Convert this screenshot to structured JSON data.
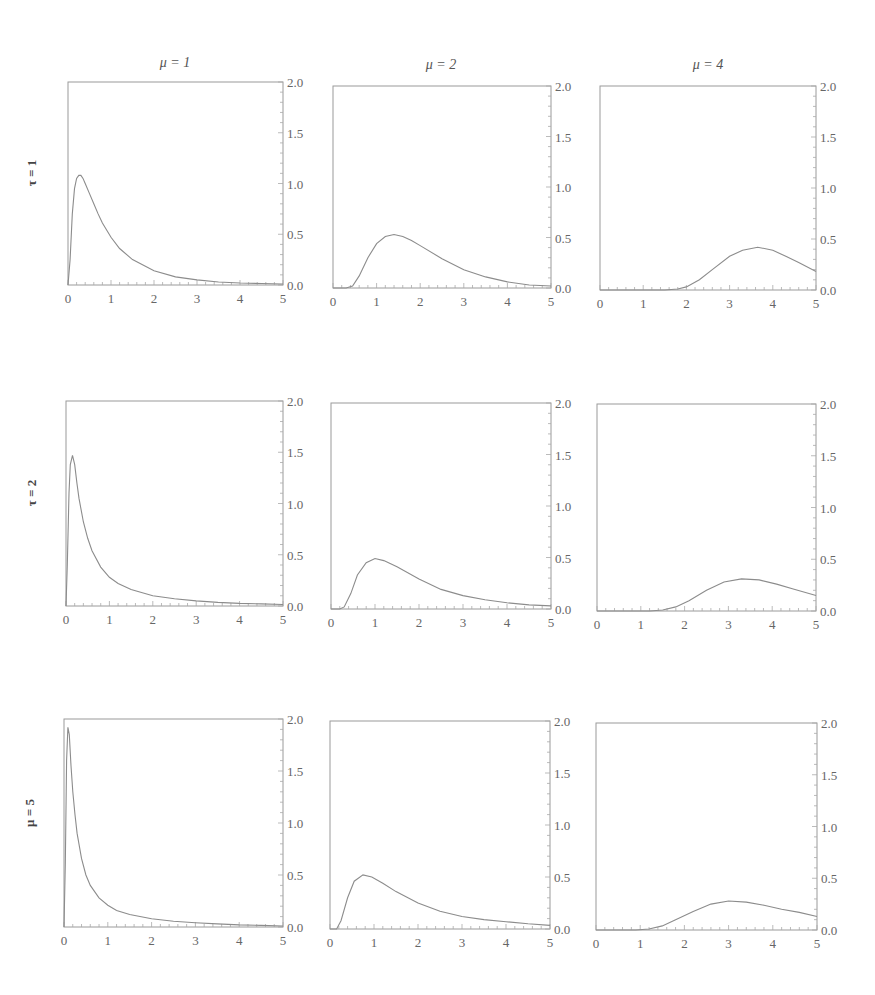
{
  "figure": {
    "column_titles": [
      "μ = 1",
      "μ = 2",
      "μ = 4"
    ],
    "row_titles": [
      "τ = 1",
      "τ = 2",
      "μ = 5"
    ],
    "x_ticks": [
      "0",
      "1",
      "2",
      "3",
      "4",
      "5"
    ],
    "y_ticks": [
      "0.0",
      "0.5",
      "1.0",
      "1.5",
      "2.0"
    ],
    "colors": {
      "curve": "#8c8c8c",
      "frame": "#9a9a9a",
      "text": "#666666"
    }
  },
  "chart_data": [
    {
      "type": "line",
      "row": "τ = 1",
      "col": "μ = 1",
      "xlim": [
        0,
        5
      ],
      "ylim": [
        0,
        2
      ],
      "x": [
        0,
        0.05,
        0.1,
        0.15,
        0.2,
        0.25,
        0.3,
        0.35,
        0.4,
        0.5,
        0.6,
        0.7,
        0.8,
        1.0,
        1.2,
        1.5,
        2.0,
        2.5,
        3.0,
        3.5,
        4.0,
        4.5,
        5.0
      ],
      "y": [
        0,
        0.25,
        0.7,
        0.95,
        1.05,
        1.08,
        1.08,
        1.05,
        1.0,
        0.9,
        0.8,
        0.7,
        0.61,
        0.47,
        0.36,
        0.25,
        0.14,
        0.08,
        0.05,
        0.03,
        0.02,
        0.015,
        0.01
      ]
    },
    {
      "type": "line",
      "row": "τ = 1",
      "col": "μ = 2",
      "xlim": [
        0,
        5
      ],
      "ylim": [
        0,
        2
      ],
      "x": [
        0,
        0.3,
        0.45,
        0.6,
        0.8,
        1.0,
        1.2,
        1.4,
        1.6,
        1.8,
        2.0,
        2.5,
        3.0,
        3.5,
        4.0,
        4.5,
        5.0
      ],
      "y": [
        0,
        0,
        0.02,
        0.12,
        0.3,
        0.44,
        0.51,
        0.53,
        0.51,
        0.47,
        0.42,
        0.29,
        0.18,
        0.11,
        0.06,
        0.03,
        0.02
      ]
    },
    {
      "type": "line",
      "row": "τ = 1",
      "col": "μ = 4",
      "xlim": [
        0,
        5
      ],
      "ylim": [
        0,
        2
      ],
      "x": [
        0,
        1.5,
        1.8,
        2.0,
        2.3,
        2.6,
        3.0,
        3.3,
        3.65,
        4.0,
        4.3,
        4.6,
        5.0
      ],
      "y": [
        0,
        0,
        0.01,
        0.03,
        0.1,
        0.2,
        0.33,
        0.39,
        0.42,
        0.39,
        0.33,
        0.27,
        0.18
      ]
    },
    {
      "type": "line",
      "row": "τ = 2",
      "col": "μ = 1",
      "xlim": [
        0,
        5
      ],
      "ylim": [
        0,
        2
      ],
      "x": [
        0,
        0.03,
        0.07,
        0.1,
        0.15,
        0.2,
        0.25,
        0.3,
        0.4,
        0.5,
        0.6,
        0.8,
        1.0,
        1.2,
        1.5,
        2.0,
        2.5,
        3.0,
        3.5,
        4.0,
        4.5,
        5.0
      ],
      "y": [
        0,
        0.4,
        1.1,
        1.38,
        1.47,
        1.38,
        1.2,
        1.05,
        0.82,
        0.66,
        0.54,
        0.38,
        0.28,
        0.22,
        0.16,
        0.1,
        0.07,
        0.05,
        0.035,
        0.025,
        0.02,
        0.015
      ]
    },
    {
      "type": "line",
      "row": "τ = 2",
      "col": "μ = 2",
      "xlim": [
        0,
        5
      ],
      "ylim": [
        0,
        2
      ],
      "x": [
        0,
        0.2,
        0.3,
        0.45,
        0.6,
        0.8,
        1.0,
        1.2,
        1.5,
        2.0,
        2.5,
        3.0,
        3.5,
        4.0,
        4.5,
        5.0
      ],
      "y": [
        0,
        0,
        0.02,
        0.15,
        0.33,
        0.45,
        0.49,
        0.47,
        0.41,
        0.29,
        0.19,
        0.13,
        0.09,
        0.06,
        0.04,
        0.03
      ]
    },
    {
      "type": "line",
      "row": "τ = 2",
      "col": "μ = 4",
      "xlim": [
        0,
        5
      ],
      "ylim": [
        0,
        2
      ],
      "x": [
        0,
        1.2,
        1.5,
        1.8,
        2.1,
        2.5,
        2.9,
        3.3,
        3.7,
        4.1,
        4.5,
        5.0
      ],
      "y": [
        0,
        0,
        0.01,
        0.04,
        0.1,
        0.2,
        0.28,
        0.31,
        0.3,
        0.26,
        0.21,
        0.15
      ]
    },
    {
      "type": "line",
      "row": "μ = 5",
      "col": "μ = 1",
      "xlim": [
        0,
        5
      ],
      "ylim": [
        0,
        2
      ],
      "x": [
        0,
        0.03,
        0.06,
        0.09,
        0.12,
        0.16,
        0.2,
        0.25,
        0.3,
        0.4,
        0.5,
        0.6,
        0.8,
        1.0,
        1.2,
        1.5,
        2.0,
        2.5,
        3.0,
        3.5,
        4.0,
        4.5,
        5.0
      ],
      "y": [
        0,
        0.6,
        1.6,
        1.92,
        1.85,
        1.55,
        1.3,
        1.08,
        0.9,
        0.66,
        0.5,
        0.4,
        0.28,
        0.21,
        0.16,
        0.12,
        0.08,
        0.055,
        0.04,
        0.03,
        0.02,
        0.015,
        0.01
      ]
    },
    {
      "type": "line",
      "row": "μ = 5",
      "col": "μ = 2",
      "xlim": [
        0,
        5
      ],
      "ylim": [
        0,
        2
      ],
      "x": [
        0,
        0.15,
        0.25,
        0.4,
        0.55,
        0.75,
        0.95,
        1.2,
        1.5,
        2.0,
        2.5,
        3.0,
        3.5,
        4.0,
        4.5,
        5.0
      ],
      "y": [
        0,
        0,
        0.08,
        0.3,
        0.46,
        0.52,
        0.5,
        0.44,
        0.36,
        0.25,
        0.17,
        0.12,
        0.09,
        0.07,
        0.05,
        0.035
      ]
    },
    {
      "type": "line",
      "row": "μ = 5",
      "col": "μ = 4",
      "xlim": [
        0,
        5
      ],
      "ylim": [
        0,
        2
      ],
      "x": [
        0,
        0.9,
        1.2,
        1.5,
        1.8,
        2.2,
        2.6,
        3.0,
        3.4,
        3.8,
        4.2,
        4.6,
        5.0
      ],
      "y": [
        0,
        0,
        0.01,
        0.04,
        0.1,
        0.18,
        0.25,
        0.28,
        0.27,
        0.24,
        0.2,
        0.17,
        0.13
      ]
    }
  ]
}
